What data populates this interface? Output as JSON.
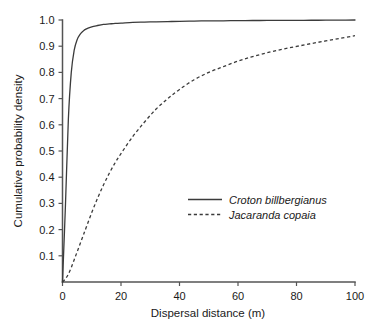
{
  "chart_data": {
    "type": "line",
    "title": "",
    "xlabel": "Dispersal distance (m)",
    "ylabel": "Cumulative probability density",
    "xlim": [
      0,
      100
    ],
    "ylim": [
      0,
      1.0
    ],
    "xticks": [
      0,
      20,
      40,
      60,
      80,
      100
    ],
    "xtick_labels": [
      "0",
      "20",
      "40",
      "60",
      "80",
      "100"
    ],
    "yticks": [
      0.1,
      0.2,
      0.3,
      0.4,
      0.5,
      0.6,
      0.7,
      0.8,
      0.9,
      1.0
    ],
    "ytick_labels": [
      "0.1",
      "0.2",
      "0.3",
      "0.4",
      "0.5",
      "0.6",
      "0.7",
      "0.8",
      "0.9",
      "1.0"
    ],
    "grid": false,
    "legend_position": "center-right",
    "axis_color": "#545454",
    "line_color": "#3b3b3b",
    "x": [
      0,
      1,
      2,
      3,
      4,
      5,
      6,
      7,
      8,
      10,
      12,
      14,
      16,
      18,
      20,
      24,
      28,
      32,
      36,
      40,
      45,
      50,
      55,
      60,
      65,
      70,
      75,
      80,
      85,
      90,
      95,
      100
    ],
    "series": [
      {
        "name": "Croton billbergianus",
        "style": "solid",
        "values": [
          0.0,
          0.29,
          0.62,
          0.8,
          0.885,
          0.925,
          0.945,
          0.957,
          0.965,
          0.974,
          0.979,
          0.983,
          0.985,
          0.987,
          0.988,
          0.991,
          0.992,
          0.993,
          0.994,
          0.995,
          0.996,
          0.9965,
          0.997,
          0.9975,
          0.998,
          0.9982,
          0.9985,
          0.9988,
          0.999,
          0.9992,
          0.9995,
          1.0
        ]
      },
      {
        "name": "Jacaranda copaia",
        "style": "dashed",
        "values": [
          0.0,
          0.012,
          0.03,
          0.055,
          0.085,
          0.115,
          0.145,
          0.175,
          0.205,
          0.265,
          0.32,
          0.37,
          0.415,
          0.455,
          0.49,
          0.555,
          0.61,
          0.66,
          0.7,
          0.735,
          0.772,
          0.8,
          0.822,
          0.843,
          0.86,
          0.875,
          0.888,
          0.899,
          0.91,
          0.92,
          0.93,
          0.94
        ]
      }
    ],
    "legend": [
      {
        "label": "Croton billbergianus",
        "style": "solid"
      },
      {
        "label": "Jacaranda copaia",
        "style": "dashed"
      }
    ]
  }
}
